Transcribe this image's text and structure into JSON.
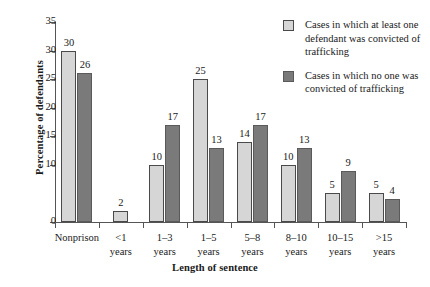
{
  "chart_data": {
    "type": "bar",
    "title": "",
    "xlabel": "Length of sentence",
    "ylabel": "Percentage of defendants",
    "ylim": [
      0,
      35
    ],
    "ytick_step": 5,
    "yticks": [
      0,
      10,
      15,
      20,
      25,
      30,
      35
    ],
    "ytick_labels": [
      "0",
      "10",
      "15",
      "20",
      "25",
      "30",
      "35"
    ],
    "grid": false,
    "legend_position": "top-right",
    "categories": [
      "Nonprison",
      "<1\nyears",
      "1–3\nyears",
      "1–5\nyears",
      "5–8\nyears",
      "8–10\nyears",
      "10–15\nyears",
      ">15\nyears"
    ],
    "series": [
      {
        "name": "Cases in which at least one defendant was convicted of trafficking",
        "color": "#d6d6d6",
        "values": [
          30,
          2,
          10,
          25,
          14,
          10,
          5,
          5
        ]
      },
      {
        "name": "Cases in which no one was convicted of trafficking",
        "color": "#7a7a7a",
        "values": [
          26,
          null,
          17,
          13,
          17,
          13,
          9,
          4
        ]
      }
    ]
  },
  "legend": {
    "entries": [
      {
        "label": "Cases in which at least one defendant was convicted of trafficking",
        "swatch": "light"
      },
      {
        "label": "Cases in which no one was convicted of trafficking",
        "swatch": "dark"
      }
    ]
  },
  "axes": {
    "y_label": "Percentage of defendants",
    "x_label": "Length of sentence"
  }
}
